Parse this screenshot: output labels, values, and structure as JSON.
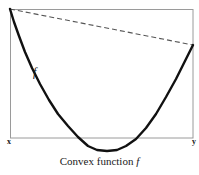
{
  "figure": {
    "caption_text": "Convex function",
    "caption_symbol": "f",
    "curve_label": "f",
    "axis_label_left": "x",
    "axis_label_right": "y",
    "colors": {
      "curve": "#111111",
      "chord_dashed": "#555555",
      "frame": "#9a9a9a",
      "background": "#ffffff",
      "text": "#1a1a1a"
    }
  },
  "chart_data": {
    "type": "line",
    "title": "Convex function f",
    "xlabel": "",
    "ylabel": "",
    "grid": false,
    "legend": false,
    "xlim": [
      10,
      193
    ],
    "ylim": [
      9,
      152
    ],
    "annotations": [
      {
        "text": "f",
        "x": 33,
        "y": 72,
        "style": "italic"
      },
      {
        "text": "x",
        "x": 8,
        "y": 142,
        "style": "bold"
      },
      {
        "text": "y",
        "x": 193,
        "y": 142,
        "style": "bold"
      }
    ],
    "frame_rect": {
      "x0": 10,
      "y0": 9,
      "x1": 193,
      "y1": 138
    },
    "series": [
      {
        "name": "convex function f",
        "style": "solid",
        "width": 2.4,
        "points": [
          [
            10,
            9
          ],
          [
            14,
            22
          ],
          [
            19,
            36
          ],
          [
            25,
            52
          ],
          [
            32,
            68
          ],
          [
            40,
            84
          ],
          [
            49,
            100
          ],
          [
            58,
            114
          ],
          [
            68,
            126
          ],
          [
            78,
            137
          ],
          [
            88,
            146
          ],
          [
            97,
            150
          ],
          [
            107,
            151
          ],
          [
            117,
            150
          ],
          [
            126,
            146
          ],
          [
            136,
            139
          ],
          [
            146,
            128
          ],
          [
            156,
            114
          ],
          [
            166,
            97
          ],
          [
            176,
            79
          ],
          [
            185,
            61
          ],
          [
            193,
            45
          ]
        ]
      },
      {
        "name": "chord (secant) from f(x) to f(y)",
        "style": "dashed",
        "width": 1.1,
        "points": [
          [
            10,
            9
          ],
          [
            193,
            45
          ]
        ]
      }
    ]
  }
}
